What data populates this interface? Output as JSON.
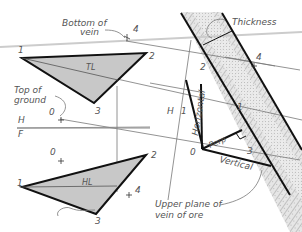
{
  "diagram": {
    "type": "descriptive-geometry",
    "labels": {
      "bottom_of_vein_1": "Bottom of",
      "bottom_of_vein_2": "vein",
      "thickness": "Thickness",
      "top_of_ground_1": "Top of",
      "top_of_ground_2": "ground",
      "tl": "TL",
      "hl": "HL",
      "h": "H",
      "f": "F",
      "h1_h": "H",
      "h1_1": "1",
      "horizontal": "Horizontal",
      "perp": "Perp",
      "vertical": "Vertical",
      "upper_plane_1": "Upper plane of",
      "upper_plane_2": "vein of ore"
    },
    "points": {
      "top_view": {
        "p1": "1",
        "p2": "2",
        "p3": "3",
        "p4": "4",
        "p0": "0"
      },
      "front_view": {
        "p1": "1",
        "p2": "2",
        "p3": "3",
        "p4": "4",
        "p0": "0"
      },
      "aux_view": {
        "p1": "1",
        "p2": "2",
        "p3": "3",
        "p4": "4",
        "p0": "0"
      }
    },
    "colors": {
      "fill": "#c8c8c8",
      "stroke": "#111111",
      "thin": "#777777",
      "fold": "#cccccc",
      "hatch": "#9a9a9a"
    }
  }
}
